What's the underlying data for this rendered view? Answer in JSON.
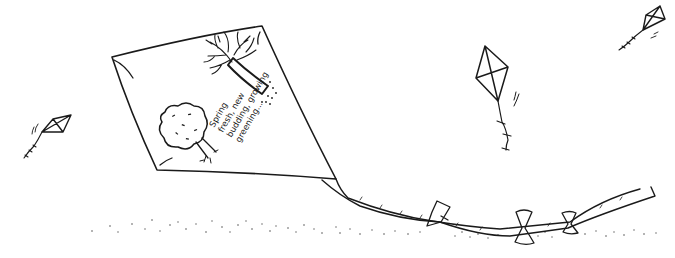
{
  "illustration": {
    "subject": "hand-drawn kites flying over stippled ground",
    "ink_color": "#1a1a1a",
    "background_color": "#ffffff",
    "big_kite": {
      "poem_lines": [
        "Spring",
        "fresh, new",
        "budding, growing",
        "greening..."
      ],
      "drawings": [
        "bare-tree",
        "leafy-tree"
      ],
      "tail_bows": 3
    },
    "small_kites": [
      {
        "position": "left"
      },
      {
        "position": "center-right"
      },
      {
        "position": "top-right"
      }
    ]
  }
}
